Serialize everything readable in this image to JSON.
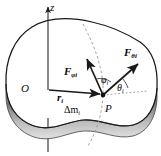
{
  "figure": {
    "background_color": "#ffffff",
    "stroke_color": "#1a1a1a",
    "band_color_dark": "#8a8a8a",
    "band_color_light": "#d5d5d5",
    "dash_color": "#9a9a9a"
  },
  "labels": {
    "axis_z": "z",
    "origin": "O",
    "point": "P",
    "position_vector": "r",
    "position_vector_sub": "i",
    "mass_element": "Δm",
    "mass_element_sub": "i",
    "force_phi": "F",
    "force_phi_sub": "φi",
    "force_theta": "F",
    "force_theta_sub": "θi",
    "angle_phi": "φ",
    "angle_phi_sub": "i",
    "angle_theta": "θ",
    "angle_theta_sub": "i"
  },
  "geometry": {
    "origin_point": [
      48,
      90
    ],
    "point_P": [
      103,
      95
    ],
    "axis_top": [
      48,
      6
    ],
    "axis_bottom": [
      48,
      152
    ],
    "force_phi_tip": [
      86,
      57
    ],
    "force_theta_tip": [
      140,
      62
    ]
  }
}
